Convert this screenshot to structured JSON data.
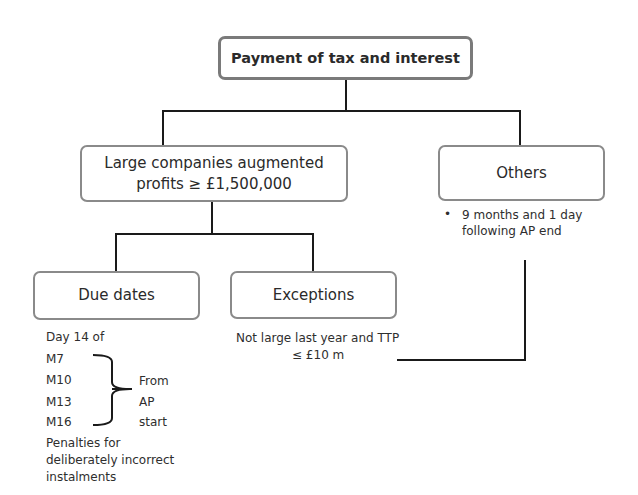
{
  "diagram": {
    "root": {
      "label": "Payment of tax and interest"
    },
    "large": {
      "label_line1": "Large companies augmented",
      "label_line2": "profits ≥ £1,500,000"
    },
    "others": {
      "label": "Others",
      "note_bullet": "•",
      "note_line1": "9 months and 1 day",
      "note_line2": "following AP end"
    },
    "due_dates": {
      "label": "Due dates",
      "intro": "Day 14 of",
      "months": [
        "M7",
        "M10",
        "M13",
        "M16"
      ],
      "brace_note": [
        "From",
        "AP",
        "start"
      ],
      "penalties": [
        "Penalties for",
        "deliberately incorrect",
        "instalments"
      ]
    },
    "exceptions": {
      "label": "Exceptions",
      "note_line1": "Not large last year and TTP",
      "note_line2": "≤ £10 m"
    }
  },
  "colors": {
    "box_border": "#8a8a8a",
    "line": "#1a1a1a",
    "text": "#2a2a2a"
  }
}
